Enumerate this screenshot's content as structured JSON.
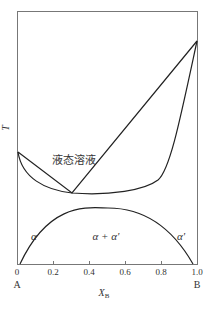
{
  "diagram": {
    "type": "binary-phase-diagram",
    "y_axis_label": "T",
    "x_axis_label": "X",
    "x_axis_subscript": "B",
    "x_ticks": [
      "0",
      "0.2",
      "0.4",
      "0.6",
      "0.8",
      "1.0"
    ],
    "left_component": "A",
    "right_component": "B",
    "regions": {
      "liquid": "液态溶液",
      "alpha": "α",
      "alpha_plus_alpha_prime": "α + α'",
      "alpha_prime": "α'"
    },
    "features": {
      "melting_point_A_norm_T": 0.44,
      "melting_point_B_norm_T": 0.88,
      "minimum_point_xB": 0.3,
      "miscibility_gap_peak_xB": 0.5
    },
    "colors": {
      "curve": "#222222",
      "frame": "#777777"
    }
  }
}
